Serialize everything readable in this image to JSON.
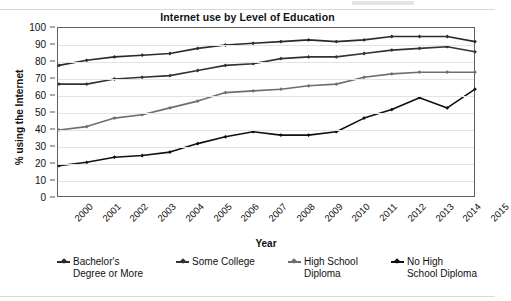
{
  "chart_data": {
    "type": "line",
    "title": "Internet use by Level of Education",
    "xlabel": "Year",
    "ylabel": "% using the Internet",
    "ylim": [
      0,
      100
    ],
    "ytick_step": 10,
    "yticks": [
      100,
      90,
      80,
      70,
      60,
      50,
      40,
      30,
      20,
      10,
      0
    ],
    "grid": true,
    "legend_position": "bottom",
    "categories": [
      "2000",
      "2001",
      "2002",
      "2003",
      "2004",
      "2005",
      "2006",
      "2007",
      "2008",
      "2009",
      "2010",
      "2011",
      "2012",
      "2013",
      "2014",
      "2015"
    ],
    "series": [
      {
        "name": "Bachelor's Degree or More",
        "legend_label": "Bachelor's\nDegree or More",
        "color": "#2b2b2b",
        "values": [
          78,
          81,
          83,
          84,
          85,
          88,
          90,
          91,
          92,
          93,
          92,
          93,
          95,
          95,
          95,
          92
        ]
      },
      {
        "name": "Some College",
        "legend_label": "Some College",
        "color": "#333333",
        "values": [
          67,
          67,
          70,
          71,
          72,
          75,
          78,
          79,
          82,
          83,
          83,
          85,
          87,
          88,
          89,
          86
        ]
      },
      {
        "name": "High School Diploma",
        "legend_label": "High School\nDiploma",
        "color": "#6e6e6e",
        "values": [
          40,
          42,
          47,
          49,
          53,
          57,
          62,
          63,
          64,
          66,
          67,
          71,
          73,
          74,
          74,
          74
        ]
      },
      {
        "name": "No High School Diploma",
        "legend_label": "No High\nSchool Diploma",
        "color": "#111111",
        "values": [
          19,
          21,
          24,
          25,
          27,
          32,
          36,
          39,
          37,
          37,
          39,
          47,
          52,
          59,
          53,
          64
        ]
      }
    ]
  }
}
